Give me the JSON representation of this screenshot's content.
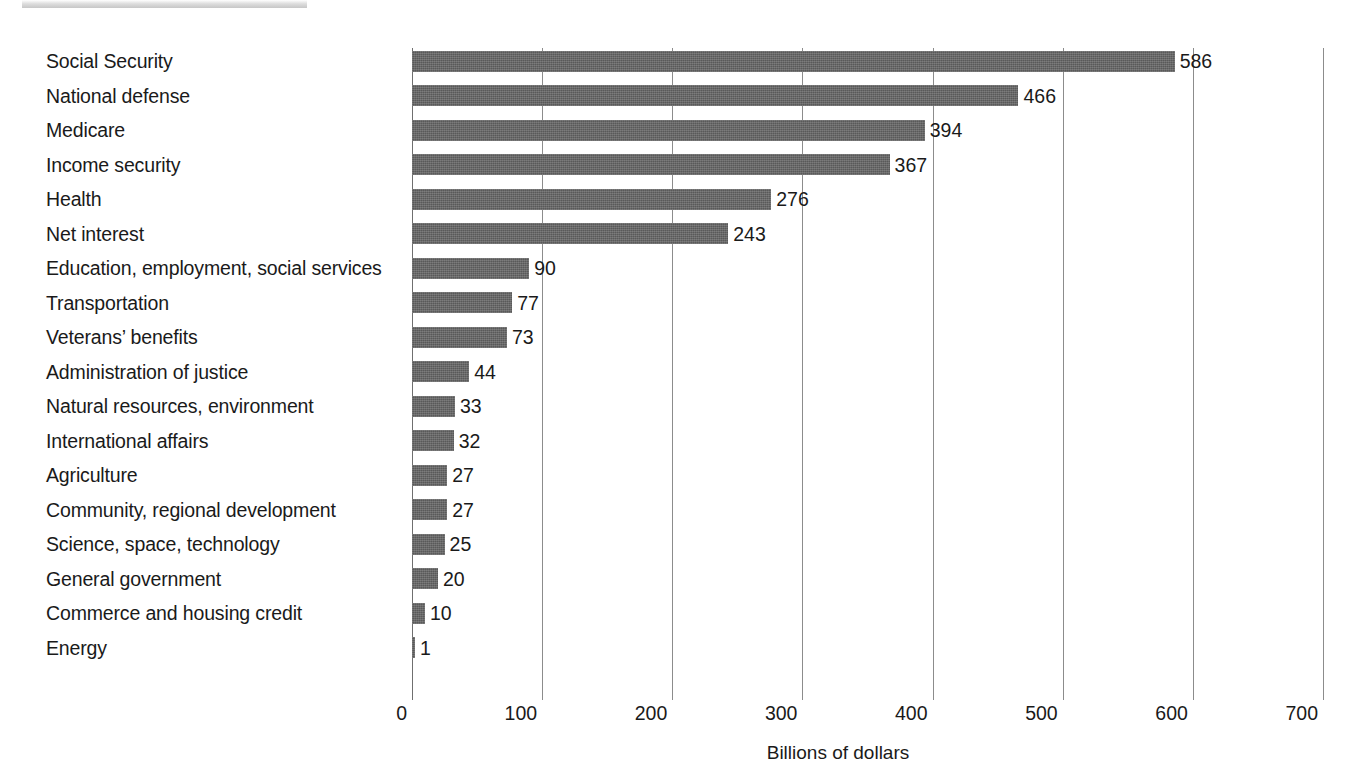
{
  "chart_data": {
    "type": "bar",
    "orientation": "horizontal",
    "title": "",
    "xlabel": "Billions of dollars",
    "ylabel": "",
    "xlim": [
      0,
      700
    ],
    "xticks": [
      0,
      100,
      200,
      300,
      400,
      500,
      600,
      700
    ],
    "xtick_labels": [
      "0",
      "100",
      "200",
      "300",
      "400",
      "500",
      "600",
      "700"
    ],
    "grid": true,
    "legend": false,
    "bar_color": "#595959",
    "categories": [
      "Social Security",
      "National defense",
      "Medicare",
      "Income security",
      "Health",
      "Net interest",
      "Education, employment, social services",
      "Transportation",
      "Veterans’ benefits",
      "Administration of justice",
      "Natural resources, environment",
      "International affairs",
      "Agriculture",
      "Community, regional development",
      "Science, space, technology",
      "General government",
      "Commerce and housing credit",
      "Energy"
    ],
    "values": [
      586,
      466,
      394,
      367,
      276,
      243,
      90,
      77,
      73,
      44,
      33,
      32,
      27,
      27,
      25,
      20,
      10,
      1
    ],
    "value_labels": [
      "586",
      "466",
      "394",
      "367",
      "276",
      "243",
      "90",
      "77",
      "73",
      "44",
      "33",
      "32",
      "27",
      "27",
      "25",
      "20",
      "10",
      "1"
    ]
  }
}
